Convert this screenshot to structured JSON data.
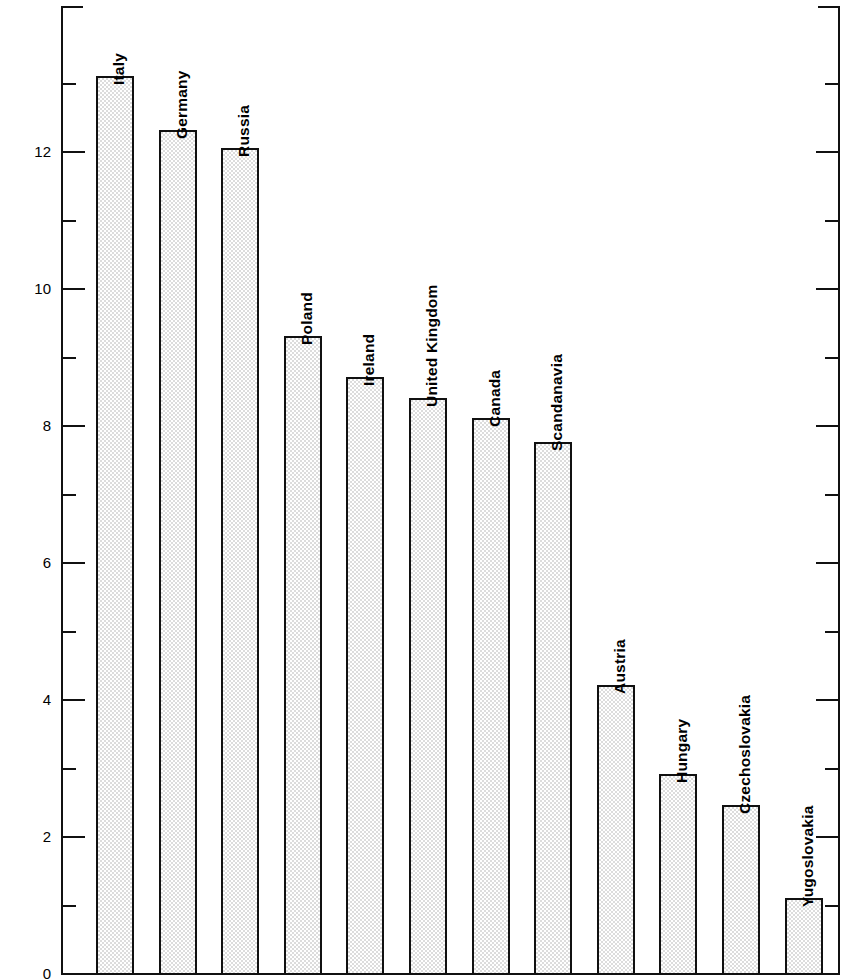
{
  "chart_data": {
    "type": "bar",
    "title": "",
    "subtitle": "",
    "xlabel": "",
    "ylabel": "Percent of total foreign−born urban population",
    "ylim": [
      0,
      14.2
    ],
    "ytick_labels": [
      "0",
      "2",
      "4",
      "6",
      "8",
      "10",
      "12"
    ],
    "ytick_values": [
      0,
      2,
      4,
      6,
      8,
      10,
      12
    ],
    "yminor_values": [
      1,
      3,
      5,
      7,
      9,
      11,
      13
    ],
    "grid": false,
    "legend": "none",
    "categories": [
      "Italy",
      "Germany",
      "Russia",
      "Poland",
      "Ireland",
      "United Kingdom",
      "Canada",
      "Scandanavia",
      "Austria",
      "Hungary",
      "Czechoslovakia",
      "Yugoslovakia"
    ],
    "values": [
      13.1,
      12.3,
      12.05,
      9.3,
      8.7,
      8.4,
      8.1,
      7.75,
      4.2,
      2.9,
      2.45,
      1.1
    ],
    "bar_fill": "#dcdcdc",
    "bar_edge": "#111111",
    "axis_color": "#111111"
  },
  "axes": {
    "left_axis_name": "y-axis",
    "right_axis_name": "y-axis-mirror",
    "bottom_axis_name": "x-axis-baseline"
  }
}
